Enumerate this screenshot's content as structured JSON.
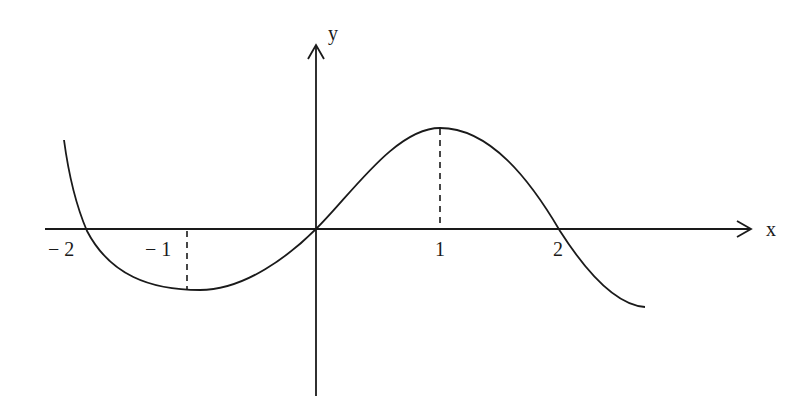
{
  "figure": {
    "type": "function-graph",
    "axes": {
      "x_label": "x",
      "y_label": "y"
    },
    "tick_labels": {
      "neg2": "− 2",
      "neg1": "− 1",
      "pos1": "1",
      "pos2": "2"
    },
    "features": {
      "local_max_at_x": 1,
      "local_min_at_x": -1,
      "zeros": [
        -2,
        0,
        2
      ],
      "dashed_guides_at_x": [
        -1,
        1
      ]
    },
    "colors": {
      "stroke": "#1a1a1a",
      "background": "#ffffff"
    }
  }
}
